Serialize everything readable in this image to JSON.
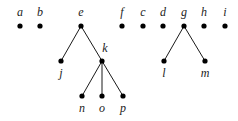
{
  "diagram": {
    "type": "forest",
    "colors": {
      "node": "#000000",
      "edge": "#1a1a1a",
      "label": "#222222"
    },
    "nodes": [
      {
        "id": "a",
        "label": "a"
      },
      {
        "id": "b",
        "label": "b"
      },
      {
        "id": "e",
        "label": "e"
      },
      {
        "id": "f",
        "label": "f"
      },
      {
        "id": "c",
        "label": "c"
      },
      {
        "id": "d",
        "label": "d"
      },
      {
        "id": "g",
        "label": "g"
      },
      {
        "id": "h",
        "label": "h"
      },
      {
        "id": "i",
        "label": "i"
      },
      {
        "id": "j",
        "label": "j"
      },
      {
        "id": "k",
        "label": "k"
      },
      {
        "id": "l",
        "label": "l"
      },
      {
        "id": "m",
        "label": "m"
      },
      {
        "id": "n",
        "label": "n"
      },
      {
        "id": "o",
        "label": "o"
      },
      {
        "id": "p",
        "label": "p"
      }
    ],
    "edges": [
      {
        "from": "e",
        "to": "j"
      },
      {
        "from": "e",
        "to": "k"
      },
      {
        "from": "k",
        "to": "n"
      },
      {
        "from": "k",
        "to": "o"
      },
      {
        "from": "k",
        "to": "p"
      },
      {
        "from": "g",
        "to": "l"
      },
      {
        "from": "g",
        "to": "m"
      }
    ]
  }
}
